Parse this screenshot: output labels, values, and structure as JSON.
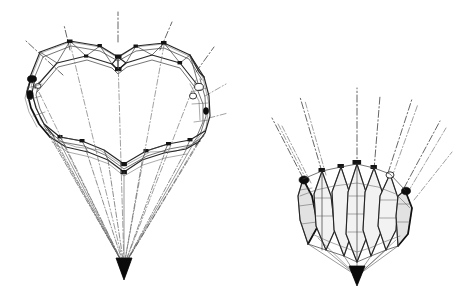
{
  "document": {
    "kind": "technical-line-drawing",
    "title": "Deployable canopy structure — two configurations",
    "medium": "scanned ink line art",
    "background_color": "#ffffff",
    "ink_color": "#1a1a1a",
    "has_text_labels": false,
    "label_text": "",
    "width_px": 465,
    "height_px": 297
  },
  "figures": [
    {
      "id": "figure-left",
      "name": "inflated-canopy",
      "caption": "",
      "description": "Fully inflated polygonal canopy framework with faceted crown truss, scalloped lower skirt and suspension lines converging to a confluence point",
      "state": "deployed",
      "bounds": {
        "x": 16,
        "y": 18,
        "w": 208,
        "h": 262
      },
      "apex": {
        "x": 124,
        "y": 268
      },
      "crown_nodes": 9,
      "skirt_nodes": 7,
      "suspension_lines": 11,
      "centerlines": 6
    },
    {
      "id": "figure-right",
      "name": "collapsed-canopy",
      "caption": "",
      "description": "Same canopy in collapsed configuration, gores folded into vertical spikes clustered about the vertical axis with rigging lines splayed upward",
      "state": "collapsed",
      "bounds": {
        "x": 272,
        "y": 88,
        "w": 180,
        "h": 196
      },
      "apex": {
        "x": 357,
        "y": 278
      },
      "spikes": 7,
      "suspension_lines": 10,
      "centerlines": 6
    }
  ],
  "line_styles": {
    "structure": "solid",
    "centerline": "dash-dot",
    "rigging": "dash-dot fine",
    "fabric": "hairline"
  },
  "colors": {
    "ink": "#1a1a1a",
    "rod": "#262626",
    "fabric": "#6a6a6a",
    "centerline": "#4a4a4a",
    "paper": "#ffffff"
  }
}
